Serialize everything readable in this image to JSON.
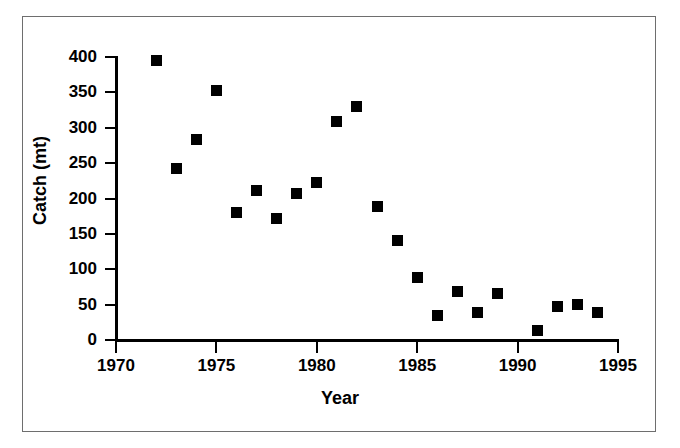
{
  "chart_data": {
    "type": "scatter",
    "title": "",
    "xlabel": "Year",
    "ylabel": "Catch (mt)",
    "xlim": [
      1970,
      1995
    ],
    "ylim": [
      0,
      400
    ],
    "grid": false,
    "legend": "none",
    "marker": "filled-square",
    "marker_color": "#000000",
    "x_ticks": [
      1970,
      1975,
      1980,
      1985,
      1990,
      1995
    ],
    "x_tick_labels": [
      "1970",
      "1975",
      "1980",
      "1985",
      "1990",
      "1995"
    ],
    "y_ticks": [
      0,
      50,
      100,
      150,
      200,
      250,
      300,
      350,
      400
    ],
    "y_tick_labels": [
      "0",
      "50",
      "100",
      "150",
      "200",
      "250",
      "300",
      "350",
      "400"
    ],
    "x": [
      1972,
      1973,
      1974,
      1975,
      1976,
      1977,
      1978,
      1979,
      1980,
      1981,
      1982,
      1983,
      1984,
      1985,
      1986,
      1987,
      1988,
      1989,
      1991,
      1992,
      1993,
      1994
    ],
    "values": [
      395,
      242,
      284,
      352,
      180,
      211,
      172,
      207,
      223,
      309,
      330,
      189,
      141,
      88,
      34,
      69,
      39,
      66,
      14,
      47,
      50,
      39
    ],
    "points": [
      {
        "x": 1972,
        "y": 395
      },
      {
        "x": 1973,
        "y": 242
      },
      {
        "x": 1974,
        "y": 284
      },
      {
        "x": 1975,
        "y": 352
      },
      {
        "x": 1976,
        "y": 180
      },
      {
        "x": 1977,
        "y": 211
      },
      {
        "x": 1978,
        "y": 172
      },
      {
        "x": 1979,
        "y": 207
      },
      {
        "x": 1980,
        "y": 223
      },
      {
        "x": 1981,
        "y": 309
      },
      {
        "x": 1982,
        "y": 330
      },
      {
        "x": 1983,
        "y": 189
      },
      {
        "x": 1984,
        "y": 141
      },
      {
        "x": 1985,
        "y": 88
      },
      {
        "x": 1986,
        "y": 34
      },
      {
        "x": 1987,
        "y": 69
      },
      {
        "x": 1988,
        "y": 39
      },
      {
        "x": 1989,
        "y": 66
      },
      {
        "x": 1991,
        "y": 14
      },
      {
        "x": 1992,
        "y": 47
      },
      {
        "x": 1993,
        "y": 50
      },
      {
        "x": 1994,
        "y": 39
      }
    ]
  }
}
